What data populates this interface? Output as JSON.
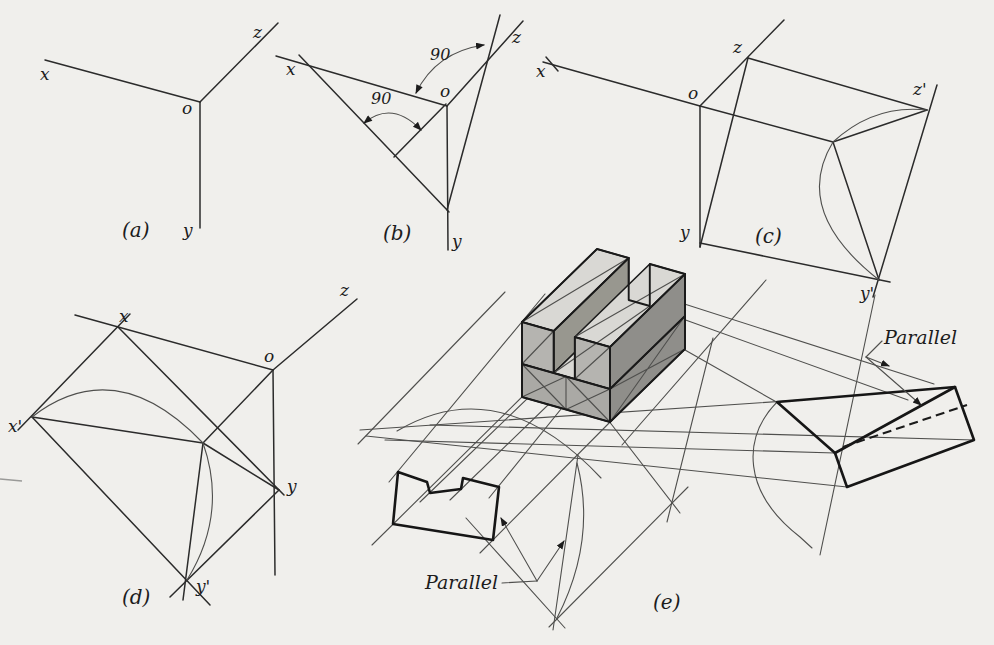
{
  "figure": {
    "type": "engineering-textbook-diagram",
    "figures": {
      "a": {
        "caption": "(a)",
        "labels": {
          "x": "x",
          "z": "z",
          "o": "o",
          "y": "y"
        }
      },
      "b": {
        "caption": "(b)",
        "labels": {
          "x": "x",
          "z": "z",
          "o": "o",
          "y": "y"
        },
        "angles": {
          "top": "90",
          "middle": "90"
        }
      },
      "c": {
        "caption": "(c)",
        "labels": {
          "x": "x",
          "z": "z",
          "o": "o",
          "y": "y",
          "z_prime": "z'",
          "y_prime": "y'"
        }
      },
      "d": {
        "caption": "(d)",
        "labels": {
          "x": "x",
          "z": "z",
          "o": "o",
          "y": "y",
          "x_prime": "x'",
          "y_prime": "y'"
        }
      },
      "e": {
        "caption": "(e)",
        "annotations": {
          "parallel_left": "Parallel",
          "parallel_right": "Parallel"
        }
      }
    },
    "colors": {
      "paper": "#f0efec",
      "ink": "#1c1c1c",
      "block_top": "#d9d8d4",
      "block_front": "#b5b4b0",
      "block_base_front": "#aaa9a5",
      "block_side": "#8f8e8a",
      "block_groove_wall": "#98978f"
    }
  }
}
